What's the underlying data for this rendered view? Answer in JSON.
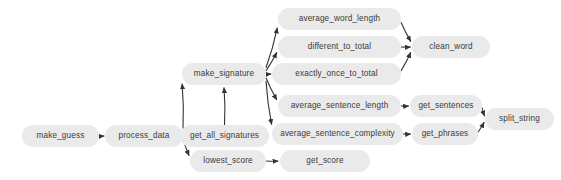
{
  "diagram": {
    "type": "call-graph",
    "title": "",
    "background_color": "#ffffff",
    "node_fill_color": "#eaeaea",
    "node_text_color": "#3a3a3a",
    "edge_color": "#333333",
    "nodes": [
      {
        "id": "make_guess",
        "label": "make_guess",
        "x": 22,
        "y": 125,
        "w": 77,
        "h": 22
      },
      {
        "id": "process_data",
        "label": "process_data",
        "x": 105,
        "y": 125,
        "w": 78,
        "h": 22
      },
      {
        "id": "get_all_signatures",
        "label": "get_all_signatures",
        "x": 180,
        "y": 125,
        "w": 89,
        "h": 22
      },
      {
        "id": "lowest_score",
        "label": "lowest_score",
        "x": 190,
        "y": 150,
        "w": 76,
        "h": 22
      },
      {
        "id": "get_score",
        "label": "get_score",
        "x": 280,
        "y": 150,
        "w": 90,
        "h": 22
      },
      {
        "id": "make_signature",
        "label": "make_signature",
        "x": 182,
        "y": 63,
        "w": 84,
        "h": 22
      },
      {
        "id": "average_word_length",
        "label": "average_word_length",
        "x": 278,
        "y": 8,
        "w": 123,
        "h": 22
      },
      {
        "id": "different_to_total",
        "label": "different_to_total",
        "x": 278,
        "y": 36,
        "w": 123,
        "h": 22
      },
      {
        "id": "exactly_once_to_total",
        "label": "exactly_once_to_total",
        "x": 272,
        "y": 63,
        "w": 129,
        "h": 22
      },
      {
        "id": "average_sentence_length",
        "label": "average_sentence_length",
        "x": 278,
        "y": 95,
        "w": 123,
        "h": 22
      },
      {
        "id": "average_sentence_complexity",
        "label": "average_sentence_complexity",
        "x": 272,
        "y": 123,
        "w": 131,
        "h": 22
      },
      {
        "id": "clean_word",
        "label": "clean_word",
        "x": 412,
        "y": 36,
        "w": 78,
        "h": 22
      },
      {
        "id": "get_sentences",
        "label": "get_sentences",
        "x": 410,
        "y": 95,
        "w": 72,
        "h": 22
      },
      {
        "id": "get_phrases",
        "label": "get_phrases",
        "x": 412,
        "y": 123,
        "w": 66,
        "h": 22
      },
      {
        "id": "split_string",
        "label": "split_string",
        "x": 485,
        "y": 108,
        "w": 69,
        "h": 22
      }
    ],
    "edges": [
      {
        "from": "make_guess",
        "to": "process_data"
      },
      {
        "from": "process_data",
        "to": "get_all_signatures"
      },
      {
        "from": "process_data",
        "to": "lowest_score"
      },
      {
        "from": "process_data",
        "to": "make_signature"
      },
      {
        "from": "get_all_signatures",
        "to": "make_signature"
      },
      {
        "from": "lowest_score",
        "to": "get_score"
      },
      {
        "from": "make_signature",
        "to": "average_word_length"
      },
      {
        "from": "make_signature",
        "to": "different_to_total"
      },
      {
        "from": "make_signature",
        "to": "exactly_once_to_total"
      },
      {
        "from": "make_signature",
        "to": "average_sentence_length"
      },
      {
        "from": "make_signature",
        "to": "average_sentence_complexity"
      },
      {
        "from": "average_word_length",
        "to": "clean_word"
      },
      {
        "from": "different_to_total",
        "to": "clean_word"
      },
      {
        "from": "exactly_once_to_total",
        "to": "clean_word"
      },
      {
        "from": "average_sentence_length",
        "to": "get_sentences"
      },
      {
        "from": "average_sentence_complexity",
        "to": "get_phrases"
      },
      {
        "from": "get_sentences",
        "to": "split_string"
      },
      {
        "from": "get_phrases",
        "to": "split_string"
      }
    ]
  }
}
